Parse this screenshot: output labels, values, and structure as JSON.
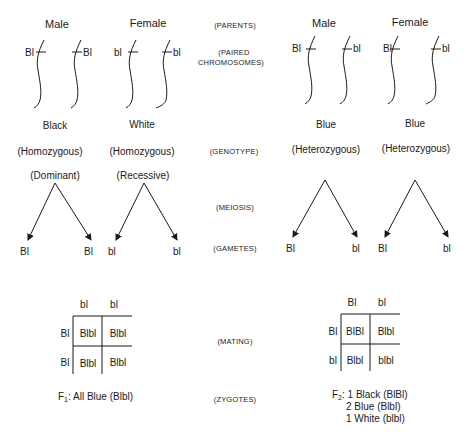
{
  "stage_labels": {
    "parents": "(PARENTS)",
    "paired_line1": "(PAIRED",
    "paired_line2": "CHROMOSOMES)",
    "genotype": "(GENOTYPE)",
    "meiosis": "(MEIOSIS)",
    "gametes": "(GAMETES)",
    "mating": "(MATING)",
    "zygotes": "(ZYGOTES)"
  },
  "p_generation": {
    "male": {
      "sex": "Male",
      "alleles": [
        "Bl",
        "Bl"
      ],
      "phenotype": "Black",
      "zygosity": "(Homozygous)",
      "dominance": "(Dominant)",
      "gametes": [
        "Bl",
        "Bl"
      ]
    },
    "female": {
      "sex": "Female",
      "alleles": [
        "bl",
        "bl"
      ],
      "phenotype": "White",
      "zygosity": "(Homozygous)",
      "dominance": "(Recessive)",
      "gametes": [
        "bl",
        "bl"
      ]
    }
  },
  "f1_generation": {
    "male": {
      "sex": "Male",
      "alleles": [
        "Bl",
        "bl"
      ],
      "phenotype": "Blue",
      "zygosity": "(Heterozygous)",
      "gametes": [
        "Bl",
        "bl"
      ]
    },
    "female": {
      "sex": "Female",
      "alleles": [
        "Bl",
        "bl"
      ],
      "phenotype": "Blue",
      "zygosity": "(Heterozygous)",
      "gametes": [
        "Bl",
        "bl"
      ]
    }
  },
  "punnett_left": {
    "col_headers": [
      "bl",
      "bl"
    ],
    "row_headers": [
      "Bl",
      "Bl"
    ],
    "cells": [
      [
        "Blbl",
        "Blbl"
      ],
      [
        "Blbl",
        "Blbl"
      ]
    ]
  },
  "punnett_right": {
    "col_headers": [
      "Bl",
      "bl"
    ],
    "row_headers": [
      "Bl",
      "bl"
    ],
    "cells": [
      [
        "BlBl",
        "Blbl"
      ],
      [
        "Blbl",
        "blbl"
      ]
    ]
  },
  "results": {
    "f1_prefix": "F",
    "f1_sub": "1",
    "f1_text": ": All Blue (Blbl)",
    "f2_prefix": "F",
    "f2_sub": "2",
    "f2_line1": ": 1 Black (BlBl)",
    "f2_line2": "2 Blue (Blbl)",
    "f2_line3": "1 White (blbl)"
  }
}
